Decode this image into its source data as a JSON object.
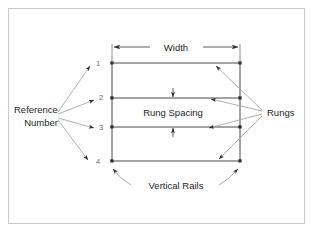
{
  "figure": {
    "type": "engineering-callout-diagram",
    "background_color": "#ffffff",
    "frame_color": "#c9c9c9",
    "line_color": "#4a4a4a",
    "text_color": "#1c1c1c",
    "number_color": "#6e6e6e"
  },
  "labels": {
    "width": "Width",
    "rung_spacing": "Rung Spacing",
    "vertical_rails": "Vertical Rails",
    "rungs": "Rungs",
    "reference_line1": "Reference",
    "reference_line2": "Number"
  },
  "reference_numbers": [
    "1",
    "2",
    "3",
    "4"
  ],
  "dimensions": [
    {
      "name": "width",
      "label": "Width",
      "orientation": "horizontal",
      "arrows": "both-ends"
    },
    {
      "name": "rung-spacing",
      "label": "Rung Spacing",
      "orientation": "vertical",
      "arrows": "both-ends"
    }
  ],
  "ladder": {
    "rail_count": 2,
    "rung_count": 4,
    "left_rail_x": 112,
    "right_rail_x": 240,
    "rung_y": [
      63,
      98,
      127,
      161
    ],
    "joint_marker": "dot"
  },
  "callouts": [
    {
      "label": "Reference Number",
      "side": "left",
      "leader_count": 4,
      "targets": [
        "1",
        "2",
        "3",
        "4"
      ]
    },
    {
      "label": "Rungs",
      "side": "right",
      "leader_count": 4,
      "targets": [
        "rung-1",
        "rung-2",
        "rung-3",
        "rung-4"
      ]
    },
    {
      "label": "Vertical Rails",
      "side": "bottom",
      "leader_count": 2,
      "targets": [
        "left-rail",
        "right-rail"
      ]
    }
  ]
}
